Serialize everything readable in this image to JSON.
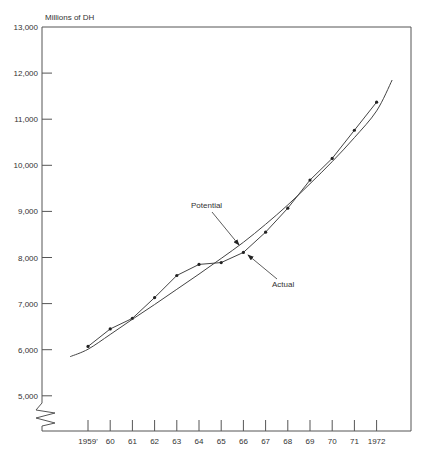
{
  "chart_data": {
    "type": "line",
    "title": "",
    "ylabel": "Millions of DH",
    "xlabel": "",
    "ylim": [
      5000,
      13000
    ],
    "y_ticks": [
      5000,
      6000,
      7000,
      8000,
      9000,
      10000,
      11000,
      12000,
      13000
    ],
    "y_tick_labels": [
      "5,000",
      "6,000",
      "7,000",
      "8,000",
      "9,000",
      "10,000",
      "11,000",
      "12,000",
      "13,000"
    ],
    "x_ticks": [
      1959,
      1960,
      1961,
      1962,
      1963,
      1964,
      1965,
      1966,
      1967,
      1968,
      1969,
      1970,
      1971,
      1972
    ],
    "x_tick_labels": [
      "1959'",
      "60",
      "61",
      "62",
      "63",
      "64",
      "65",
      "66",
      "67",
      "68",
      "69",
      "70",
      "71",
      "1972"
    ],
    "axis_break": "y-axis below 5,000",
    "grid": false,
    "series": [
      {
        "name": "Actual",
        "markers": true,
        "x": [
          1959,
          1960,
          1961,
          1962,
          1963,
          1964,
          1965,
          1966,
          1967,
          1968,
          1969,
          1970,
          1971,
          1972
        ],
        "values": [
          6070,
          6450,
          6680,
          7130,
          7610,
          7850,
          7890,
          8110,
          8550,
          9070,
          9680,
          10150,
          10760,
          11370
        ]
      },
      {
        "name": "Potential",
        "markers": false,
        "x": [
          1958.2,
          1959,
          1960,
          1961,
          1962,
          1963,
          1964,
          1965,
          1966,
          1967,
          1968,
          1969,
          1970,
          1971,
          1972,
          1972.7
        ],
        "values": [
          5850,
          6010,
          6330,
          6660,
          6980,
          7310,
          7640,
          7980,
          8330,
          8720,
          9140,
          9600,
          10080,
          10600,
          11180,
          11850
        ]
      }
    ],
    "annotations": [
      {
        "text": "Potential",
        "points_to": "Potential",
        "at_x": 1966
      },
      {
        "text": "Actual",
        "points_to": "Actual",
        "at_x": 1966
      }
    ]
  }
}
